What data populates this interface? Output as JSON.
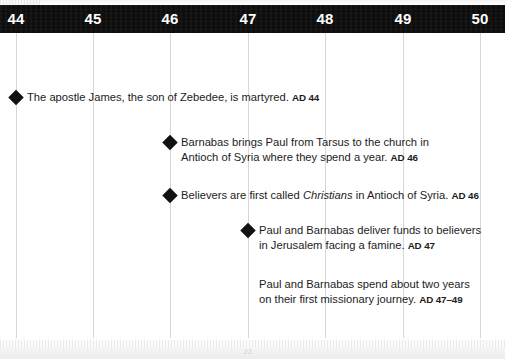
{
  "document": {
    "kind": "timeline-chart",
    "title": "AD 44-50 Timeline"
  },
  "colors": {
    "band_background": "#0d0d0d",
    "band_text": "#ffffff",
    "gridline": "#d7d7d7",
    "body_text": "#1c1c1c",
    "marker": "#111111",
    "page_background": "#ffffff"
  },
  "axis": {
    "years": [
      {
        "label": "44",
        "x": 16
      },
      {
        "label": "45",
        "x": 93
      },
      {
        "label": "46",
        "x": 170
      },
      {
        "label": "47",
        "x": 248
      },
      {
        "label": "48",
        "x": 325
      },
      {
        "label": "49",
        "x": 403
      },
      {
        "label": "50",
        "x": 480
      }
    ],
    "range": [
      44,
      50
    ],
    "gridline_x": [
      16,
      93,
      170,
      248,
      325,
      403,
      480
    ]
  },
  "events": [
    {
      "id": "james-martyred",
      "marker": true,
      "marker_x": 16,
      "text_x": 27,
      "y": 90,
      "year_label": "AD 44",
      "lines": [
        [
          {
            "t": "The apostle James, the son of Zebedee, is martyred. ",
            "style": "normal"
          },
          {
            "t": "AD 44",
            "style": "ad"
          }
        ]
      ]
    },
    {
      "id": "barnabas-brings-paul",
      "marker": true,
      "marker_x": 170,
      "text_x": 181,
      "y": 135,
      "year_label": "AD 46",
      "lines": [
        [
          {
            "t": "Barnabas brings Paul from Tarsus to the church in",
            "style": "normal"
          }
        ],
        [
          {
            "t": "Antioch of Syria where they spend a year. ",
            "style": "normal"
          },
          {
            "t": "AD 46",
            "style": "ad"
          }
        ]
      ]
    },
    {
      "id": "called-christians",
      "marker": true,
      "marker_x": 170,
      "text_x": 181,
      "y": 188,
      "year_label": "AD 46",
      "lines": [
        [
          {
            "t": "Believers are first called ",
            "style": "normal"
          },
          {
            "t": "Christians",
            "style": "italic"
          },
          {
            "t": " in Antioch of Syria. ",
            "style": "normal"
          },
          {
            "t": "AD 46",
            "style": "ad"
          }
        ]
      ]
    },
    {
      "id": "famine-relief-funds",
      "marker": true,
      "marker_x": 248,
      "text_x": 259,
      "y": 223,
      "year_label": "AD 47",
      "lines": [
        [
          {
            "t": "Paul and Barnabas deliver funds to believers",
            "style": "normal"
          }
        ],
        [
          {
            "t": "in Jerusalem facing a famine. ",
            "style": "normal"
          },
          {
            "t": "AD 47",
            "style": "ad"
          }
        ]
      ]
    },
    {
      "id": "first-missionary-journey",
      "marker": false,
      "marker_x": null,
      "text_x": 259,
      "y": 277,
      "year_label": "AD 47–49",
      "lines": [
        [
          {
            "t": "Paul and Barnabas spend about two years",
            "style": "normal"
          }
        ],
        [
          {
            "t": "on their first missionary journey. ",
            "style": "normal"
          },
          {
            "t": "AD 47–49",
            "style": "ad"
          }
        ]
      ]
    }
  ],
  "folio": {
    "text": "22"
  }
}
